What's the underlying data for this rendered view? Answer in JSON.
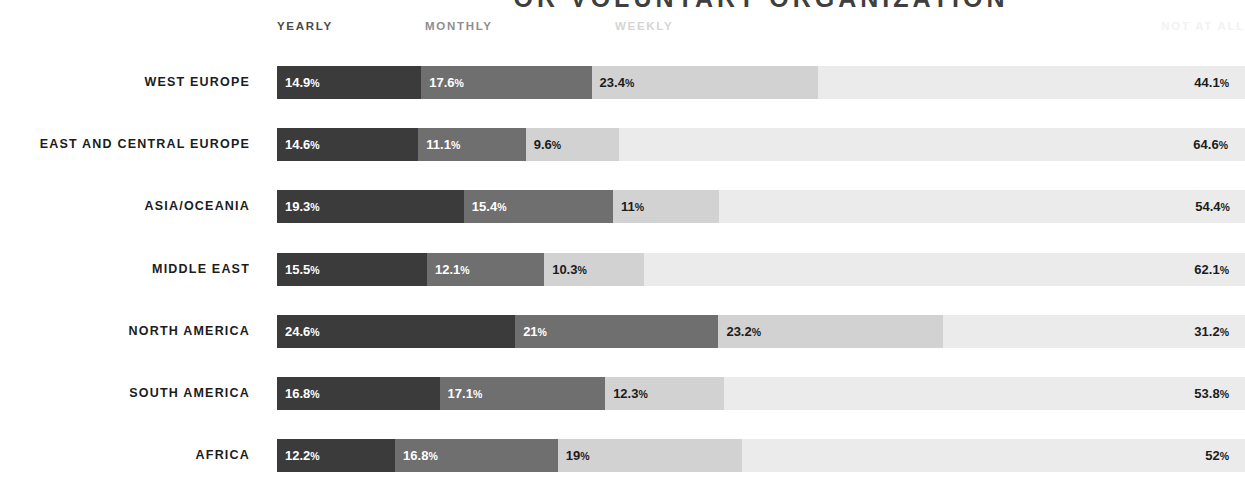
{
  "title": "OR VOLUNTARY ORGANIZATION",
  "legend": {
    "yearly": "YEARLY",
    "monthly": "MONTHLY",
    "weekly": "WEEKLY",
    "not_at_all": "NOT AT ALL"
  },
  "colors": {
    "yearly": "#3b3b3b",
    "monthly": "#6f6f6f",
    "weekly": "#d2d2d2",
    "not_at_all": "#ebebeb",
    "label": "#1c1c1c",
    "background": "#ffffff"
  },
  "chart_data": {
    "type": "bar",
    "title": "OR VOLUNTARY ORGANIZATION",
    "xlabel": "",
    "ylabel": "",
    "xlim": [
      0,
      100
    ],
    "grid": false,
    "stacked": true,
    "normalized_percent": true,
    "orientation": "horizontal",
    "legend_position": "top",
    "categories": [
      "WEST EUROPE",
      "EAST AND CENTRAL EUROPE",
      "ASIA/OCEANIA",
      "MIDDLE EAST",
      "NORTH AMERICA",
      "SOUTH AMERICA",
      "AFRICA"
    ],
    "series": [
      {
        "name": "YEARLY",
        "values": [
          14.9,
          14.6,
          19.3,
          15.5,
          24.6,
          16.8,
          12.2
        ]
      },
      {
        "name": "MONTHLY",
        "values": [
          17.6,
          11.1,
          15.4,
          12.1,
          21.0,
          17.1,
          16.8
        ]
      },
      {
        "name": "WEEKLY",
        "values": [
          23.4,
          9.6,
          11.0,
          10.3,
          23.2,
          12.3,
          19.0
        ]
      },
      {
        "name": "NOT AT ALL",
        "values": [
          44.1,
          64.6,
          54.4,
          62.1,
          31.2,
          53.8,
          52.0
        ]
      }
    ]
  },
  "rows": [
    {
      "label": "WEST EUROPE",
      "segments": [
        {
          "key": "yearly",
          "value": 14.9,
          "text": "14.9",
          "unit": "%"
        },
        {
          "key": "monthly",
          "value": 17.6,
          "text": "17.6",
          "unit": "%"
        },
        {
          "key": "weekly",
          "value": 23.4,
          "text": "23.4",
          "unit": "%"
        },
        {
          "key": "not_at_all",
          "value": 44.1,
          "text": "44.1",
          "unit": "%"
        }
      ]
    },
    {
      "label": "EAST AND CENTRAL EUROPE",
      "segments": [
        {
          "key": "yearly",
          "value": 14.6,
          "text": "14.6",
          "unit": "%"
        },
        {
          "key": "monthly",
          "value": 11.1,
          "text": "11.1",
          "unit": "%"
        },
        {
          "key": "weekly",
          "value": 9.6,
          "text": "9.6",
          "unit": "%"
        },
        {
          "key": "not_at_all",
          "value": 64.6,
          "text": "64.6",
          "unit": "%"
        }
      ]
    },
    {
      "label": "ASIA/OCEANIA",
      "segments": [
        {
          "key": "yearly",
          "value": 19.3,
          "text": "19.3",
          "unit": "%"
        },
        {
          "key": "monthly",
          "value": 15.4,
          "text": "15.4",
          "unit": "%"
        },
        {
          "key": "weekly",
          "value": 11.0,
          "text": "11",
          "unit": "%"
        },
        {
          "key": "not_at_all",
          "value": 54.4,
          "text": "54.4",
          "unit": "%"
        }
      ]
    },
    {
      "label": "MIDDLE EAST",
      "segments": [
        {
          "key": "yearly",
          "value": 15.5,
          "text": "15.5",
          "unit": "%"
        },
        {
          "key": "monthly",
          "value": 12.1,
          "text": "12.1",
          "unit": "%"
        },
        {
          "key": "weekly",
          "value": 10.3,
          "text": "10.3",
          "unit": "%"
        },
        {
          "key": "not_at_all",
          "value": 62.1,
          "text": "62.1",
          "unit": "%"
        }
      ]
    },
    {
      "label": "NORTH AMERICA",
      "segments": [
        {
          "key": "yearly",
          "value": 24.6,
          "text": "24.6",
          "unit": "%"
        },
        {
          "key": "monthly",
          "value": 21.0,
          "text": "21",
          "unit": "%"
        },
        {
          "key": "weekly",
          "value": 23.2,
          "text": "23.2",
          "unit": "%"
        },
        {
          "key": "not_at_all",
          "value": 31.2,
          "text": "31.2",
          "unit": "%"
        }
      ]
    },
    {
      "label": "SOUTH AMERICA",
      "segments": [
        {
          "key": "yearly",
          "value": 16.8,
          "text": "16.8",
          "unit": "%"
        },
        {
          "key": "monthly",
          "value": 17.1,
          "text": "17.1",
          "unit": "%"
        },
        {
          "key": "weekly",
          "value": 12.3,
          "text": "12.3",
          "unit": "%"
        },
        {
          "key": "not_at_all",
          "value": 53.8,
          "text": "53.8",
          "unit": "%"
        }
      ]
    },
    {
      "label": "AFRICA",
      "segments": [
        {
          "key": "yearly",
          "value": 12.2,
          "text": "12.2",
          "unit": "%"
        },
        {
          "key": "monthly",
          "value": 16.8,
          "text": "16.8",
          "unit": "%"
        },
        {
          "key": "weekly",
          "value": 19.0,
          "text": "19",
          "unit": "%"
        },
        {
          "key": "not_at_all",
          "value": 52.0,
          "text": "52",
          "unit": "%"
        }
      ]
    }
  ]
}
